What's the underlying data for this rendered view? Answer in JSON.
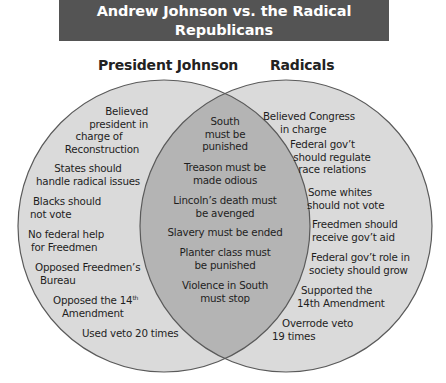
{
  "header": {
    "title": "Andrew Johnson vs. the Radical Republicans",
    "subtitle": "Similarities and Differences"
  },
  "colors": {
    "header_bg": "#545454",
    "circle_fill": "#dadada",
    "overlap_fill": "#b4b4b4",
    "stroke": "#5a5a5a"
  },
  "sets": {
    "left": {
      "title": "President Johnson",
      "items": [
        [
          "Believed",
          "president in",
          "charge of",
          "Reconstruction"
        ],
        [
          "States should",
          "handle radical issues"
        ],
        [
          "Blacks should",
          "not vote"
        ],
        [
          "No federal help",
          "for Freedmen"
        ],
        [
          "Opposed Freedmen’s",
          "Bureau"
        ],
        [
          "Opposed the 14",
          "Amendment"
        ],
        [
          "Used veto 20 times"
        ]
      ],
      "sup_th": "th"
    },
    "both": {
      "items": [
        [
          "South",
          "must be",
          "punished"
        ],
        [
          "Treason must be",
          "made odious"
        ],
        [
          "Lincoln’s death must",
          "be avenged"
        ],
        [
          "Slavery must be ended"
        ],
        [
          "Planter class must",
          "be punished"
        ],
        [
          "Violence in South",
          "must stop"
        ]
      ]
    },
    "right": {
      "title": "Radicals",
      "items": [
        [
          "Believed Congress",
          "in charge"
        ],
        [
          "Federal gov’t",
          "should regulate",
          "race relations"
        ],
        [
          "Some whites",
          "should not vote"
        ],
        [
          "Freedmen should",
          "receive gov’t aid"
        ],
        [
          "Federal gov’t role in",
          "society should grow"
        ],
        [
          "Supported the",
          "14th Amendment"
        ],
        [
          "Overrode veto",
          "19 times"
        ]
      ]
    }
  }
}
